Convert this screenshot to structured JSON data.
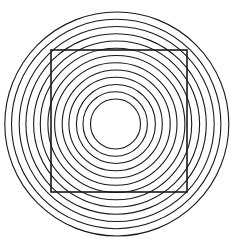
{
  "canvas": {
    "width": 234,
    "height": 246,
    "background_color": "#ffffff"
  },
  "figure": {
    "stroke_color": "#1a1a1a",
    "fill": "none"
  },
  "chart_data": {
    "type": "scatter",
    "subtitle": "",
    "xlabel": "",
    "ylabel": "",
    "xlim": [
      0,
      234
    ],
    "ylim": [
      0,
      246
    ],
    "grid": false,
    "legend": "none",
    "annotations": [],
    "tick_labels": {
      "x": [],
      "y": []
    },
    "series": [
      {
        "name": "concentric-rings",
        "shape": "circle",
        "stroke": "#1a1a1a",
        "stroke_width": 1.1,
        "fill": "none",
        "count": 13,
        "center": {
          "x": 116,
          "y": 124
        },
        "inner_radius": 25,
        "outer_radius": 112,
        "radial_spacing": 7.25,
        "circles": [
          {
            "index": 1,
            "cx": 115.5,
            "cy": 124.0,
            "r": 25.0
          },
          {
            "index": 2,
            "cx": 115.2,
            "cy": 124.0,
            "r": 32.2
          },
          {
            "index": 3,
            "cx": 115.9,
            "cy": 124.0,
            "r": 39.5
          },
          {
            "index": 4,
            "cx": 115.6,
            "cy": 124.0,
            "r": 46.7
          },
          {
            "index": 5,
            "cx": 116.2,
            "cy": 124.0,
            "r": 54.0
          },
          {
            "index": 6,
            "cx": 115.8,
            "cy": 124.0,
            "r": 61.2
          },
          {
            "index": 7,
            "cx": 116.4,
            "cy": 124.0,
            "r": 68.5
          },
          {
            "index": 8,
            "cx": 116.0,
            "cy": 124.0,
            "r": 75.7
          },
          {
            "index": 9,
            "cx": 116.6,
            "cy": 124.0,
            "r": 83.0
          },
          {
            "index": 10,
            "cx": 116.1,
            "cy": 124.0,
            "r": 90.2
          },
          {
            "index": 11,
            "cx": 116.7,
            "cy": 124.0,
            "r": 97.5
          },
          {
            "index": 12,
            "cx": 116.2,
            "cy": 124.0,
            "r": 104.7
          },
          {
            "index": 13,
            "cx": 116.8,
            "cy": 124.0,
            "r": 112.0
          }
        ]
      },
      {
        "name": "overlay-square",
        "shape": "rect",
        "stroke": "#1a1a1a",
        "stroke_width": 1.6,
        "fill": "none",
        "count": 1,
        "rect": {
          "x": 51,
          "y": 50,
          "width": 136,
          "height": 142
        },
        "corners": [
          {
            "label": "top-left",
            "x": 51,
            "y": 50
          },
          {
            "label": "top-right",
            "x": 187,
            "y": 50
          },
          {
            "label": "bottom-right",
            "x": 187,
            "y": 192
          },
          {
            "label": "bottom-left",
            "x": 51,
            "y": 192
          }
        ]
      }
    ]
  }
}
